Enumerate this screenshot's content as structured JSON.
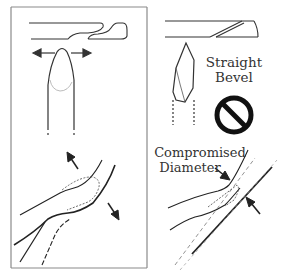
{
  "figure": {
    "panels": [
      {
        "id": "top-left",
        "description": "Needle with curved lancet bevel above a fingertip-shaped tip; double arrows indicate lateral spreading"
      },
      {
        "id": "top-right",
        "description": "Needle with straight bevel above a sharp lancet tip",
        "label_line1": "Straight",
        "label_line2": "Bevel",
        "symbol": "prohibited-icon"
      },
      {
        "id": "bottom-left",
        "description": "Vessel anastomosis with sutures; arrows indicate outward stretch"
      },
      {
        "id": "bottom-right",
        "description": "Vessel anastomosis with narrowing",
        "label_line1": "Compromised",
        "label_line2": "Diameter"
      }
    ],
    "colors": {
      "line": "#222222",
      "frame": "#777777",
      "dashed": "#888888"
    }
  }
}
